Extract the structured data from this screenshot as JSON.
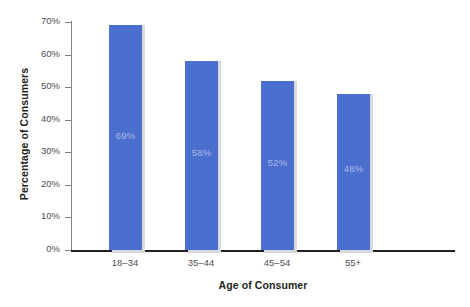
{
  "chart_data": {
    "type": "bar",
    "title": "",
    "xlabel": "Age of Consumer",
    "ylabel": "Percentage of Consumers",
    "categories": [
      "18–34",
      "35–44",
      "45–54",
      "55+"
    ],
    "values": [
      69,
      58,
      52,
      48
    ],
    "value_labels": [
      "69%",
      "58%",
      "52%",
      "48%"
    ],
    "ylim": [
      0,
      70
    ],
    "ytick_values": [
      0,
      10,
      20,
      30,
      40,
      50,
      60,
      70
    ],
    "ytick_labels": [
      "0%",
      "10%",
      "20%",
      "30%",
      "40%",
      "50%",
      "60%",
      "70%"
    ],
    "grid": false,
    "legend": "none",
    "bar_color": "#4a6fce",
    "bar_shadow_color": "#d9dade",
    "value_label_color": "#aebae4",
    "axis_color": "#231f20",
    "tick_color": "#808285",
    "background_color": "#ffffff"
  }
}
